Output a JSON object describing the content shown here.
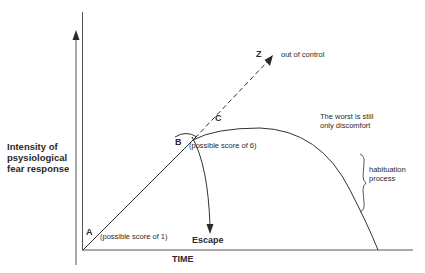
{
  "diagram": {
    "y_axis_label": "Intensity of psysiological fear response",
    "x_axis_label": "TIME",
    "points": {
      "A": "A",
      "B": "B",
      "C": "C",
      "Z": "Z"
    },
    "annotations": {
      "a_score": "(possible score of 1)",
      "b_score": "(possible score of 6)",
      "out_of_control": "out of control",
      "worst_line1": "The worst is still",
      "worst_line2": "only discomfort",
      "habituation_line1": "habituation",
      "habituation_line2": "process",
      "escape": "Escape"
    },
    "colors": {
      "ink": "#2a2a2a",
      "axis": "#555555",
      "background": "#ffffff"
    }
  }
}
